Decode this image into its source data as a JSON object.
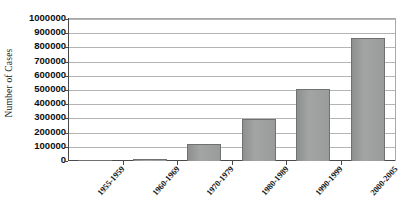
{
  "chart_data": {
    "type": "bar",
    "title": "",
    "xlabel": "",
    "ylabel": "Number of Cases",
    "categories": [
      "1955-1959",
      "1960-1969",
      "1970-1979",
      "1980-1989",
      "1990-1999",
      "2000-2005"
    ],
    "values": [
      1500,
      14000,
      118000,
      295000,
      510000,
      865000
    ],
    "ylim": [
      0,
      1000000
    ],
    "ytick_values": [
      0,
      100000,
      200000,
      300000,
      400000,
      500000,
      600000,
      700000,
      800000,
      900000,
      1000000
    ],
    "ytick_labels": [
      "0",
      "100000",
      "200000",
      "300000",
      "400000",
      "500000",
      "600000",
      "700000",
      "800000",
      "900000",
      "1000000"
    ],
    "grid": true,
    "grid_axis": "y",
    "legend": false,
    "legend_position": "none",
    "series": [
      {
        "name": "Number of Cases",
        "values": [
          1500,
          14000,
          118000,
          295000,
          510000,
          865000
        ]
      }
    ],
    "bar_color": "#9a9b9b",
    "bar_border_color": "#6f7070",
    "axis_color": "#4a4a4a",
    "gridline_color": "#b4b4b4",
    "background_color": "#ffffff",
    "xtick_rotation": -48,
    "annotations": []
  }
}
